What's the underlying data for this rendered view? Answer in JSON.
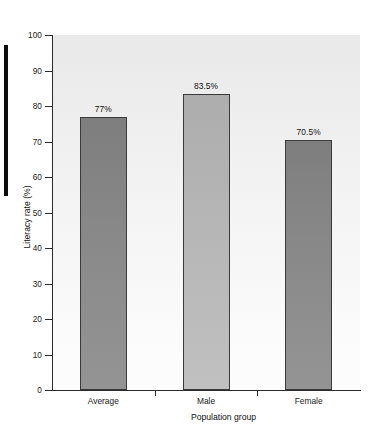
{
  "figure": {
    "edge_marker_color": "#0d0d0d",
    "plot_bg_top": "#e9e9e9",
    "plot_bg_bottom": "#fdfdfd",
    "axis_color": "#2b2b2b"
  },
  "chart_data": {
    "type": "bar",
    "title": "",
    "xlabel": "Population group",
    "ylabel": "Literacy rate (%)",
    "categories": [
      "Average",
      "Male",
      "Female"
    ],
    "values": [
      77,
      83.5,
      70.5
    ],
    "value_labels": [
      "77%",
      "83.5%",
      "70.5%"
    ],
    "bar_colors": [
      "#8a8a8a",
      "#b4b4b4",
      "#858585"
    ],
    "bar_border_color": "#3a3a3a",
    "ylim": [
      0,
      100
    ],
    "yticks": [
      0,
      10,
      20,
      30,
      40,
      50,
      60,
      70,
      80,
      90,
      100
    ],
    "ytick_labels": [
      "0",
      "10",
      "20",
      "30",
      "40",
      "50",
      "60",
      "70",
      "80",
      "90",
      "100"
    ],
    "grid": false,
    "legend": null
  }
}
